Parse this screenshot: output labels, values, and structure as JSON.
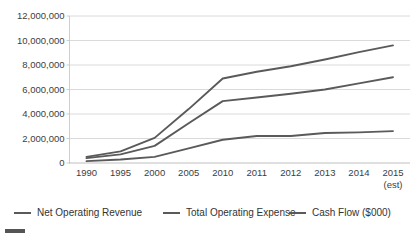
{
  "chart_data": {
    "type": "line",
    "title": "",
    "xlabel": "",
    "ylabel": "",
    "categories": [
      "1990",
      "1995",
      "2000",
      "2005",
      "2010",
      "2011",
      "2012",
      "2013",
      "2014",
      "2015"
    ],
    "category_sublabels": [
      "",
      "",
      "",
      "",
      "",
      "",
      "",
      "",
      "",
      "(est)"
    ],
    "ylim": [
      0,
      12000000
    ],
    "ytick_values": [
      0,
      2000000,
      4000000,
      6000000,
      8000000,
      10000000,
      12000000
    ],
    "ytick_labels": [
      "0",
      "2,000,000",
      "4,000,000",
      "6,000,000",
      "8,000,000",
      "10,000,000",
      "12,000,000"
    ],
    "grid": true,
    "legend_position": "bottom",
    "series": [
      {
        "name": "Net Operating Revenue",
        "color": "#5a5a5a",
        "values": [
          500000,
          950000,
          2050000,
          4400000,
          6900000,
          7450000,
          7900000,
          8450000,
          9050000,
          9600000
        ]
      },
      {
        "name": "Total Operating Expense",
        "color": "#5a5a5a",
        "values": [
          400000,
          700000,
          1400000,
          3250000,
          5050000,
          5350000,
          5650000,
          6000000,
          6500000,
          7000000
        ]
      },
      {
        "name": "Cash Flow ($000)",
        "color": "#5a5a5a",
        "values": [
          150000,
          280000,
          500000,
          1200000,
          1900000,
          2200000,
          2200000,
          2450000,
          2500000,
          2600000
        ]
      }
    ]
  },
  "legend": {
    "items": [
      {
        "label": "Net Operating Revenue"
      },
      {
        "label": "Total Operating Expense"
      },
      {
        "label": "Cash Flow ($000)"
      }
    ]
  }
}
